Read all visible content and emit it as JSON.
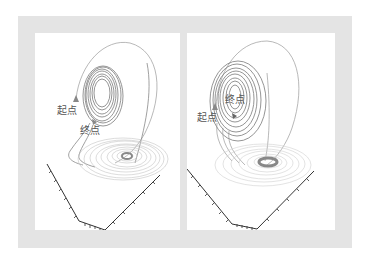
{
  "figure": {
    "panels": [
      {
        "id": "left",
        "start_label": "起点",
        "end_label": "终点"
      },
      {
        "id": "right",
        "start_label": "起点",
        "end_label": "终点"
      }
    ]
  },
  "colors": {
    "frame": "#e4e4e4",
    "panel_bg": "#ffffff",
    "trajectory": "#888888",
    "axis": "#333333",
    "label": "#555555"
  }
}
